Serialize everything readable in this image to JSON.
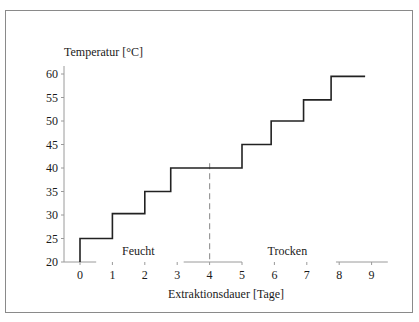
{
  "chart_data": {
    "type": "line",
    "subtype": "step",
    "title": "",
    "ylabel": "Temperatur [°C]",
    "xlabel": "Extraktionsdauer [Tage]",
    "xlim": [
      -0.5,
      9.5
    ],
    "ylim": [
      20,
      60
    ],
    "xticks": [
      0,
      1,
      2,
      3,
      4,
      5,
      6,
      7,
      8,
      9
    ],
    "yticks": [
      20,
      25,
      30,
      35,
      40,
      45,
      50,
      55,
      60
    ],
    "grid": false,
    "series": [
      {
        "name": "Temperatur",
        "color": "#222222",
        "points": [
          [
            0,
            20
          ],
          [
            0,
            25
          ],
          [
            1.0,
            25
          ],
          [
            1.0,
            30.3
          ],
          [
            2.0,
            30.3
          ],
          [
            2.0,
            35
          ],
          [
            2.8,
            35
          ],
          [
            2.8,
            40
          ],
          [
            5.0,
            40
          ],
          [
            5.0,
            45
          ],
          [
            5.9,
            45
          ],
          [
            5.9,
            50
          ],
          [
            6.9,
            50
          ],
          [
            6.9,
            54.5
          ],
          [
            7.75,
            54.5
          ],
          [
            7.75,
            59.5
          ],
          [
            8.8,
            59.5
          ]
        ]
      }
    ],
    "divider": {
      "x": 4,
      "y_top": 41,
      "style": "dashed",
      "color": "#999999"
    },
    "x_axis_segments": [
      [
        -0.5,
        0.5
      ],
      [
        3.2,
        5.0
      ],
      [
        7.9,
        9.5
      ]
    ],
    "annotations": [
      {
        "text": "Feucht",
        "x": 1.8,
        "y": 21.5
      },
      {
        "text": "Trocken",
        "x": 6.4,
        "y": 21.5
      }
    ]
  }
}
